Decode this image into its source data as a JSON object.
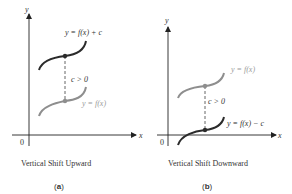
{
  "panels": [
    {
      "id": "a",
      "caption": "Vertical Shift Upward",
      "letter_open": "(",
      "letter": "a",
      "letter_close": ")",
      "axis_x_label": "x",
      "axis_y_label": "y",
      "origin_label": "0",
      "top_curve_label": "y = f(x) + c",
      "bottom_curve_label": "y = f(x)",
      "shift_label": "c > 0"
    },
    {
      "id": "b",
      "caption": "Vertical Shift Downward",
      "letter_open": "(",
      "letter": "b",
      "letter_close": ")",
      "axis_x_label": "x",
      "axis_y_label": "y",
      "origin_label": "0",
      "top_curve_label": "y = f(x)",
      "bottom_curve_label": "y = f(x) − c",
      "shift_label": "c > 0"
    }
  ],
  "colors": {
    "axis": "#222222",
    "shifted_curve": "#2b2b2b",
    "original_curve": "#8e8e8e",
    "original_label": "#9a9a9a",
    "text": "#333333"
  }
}
